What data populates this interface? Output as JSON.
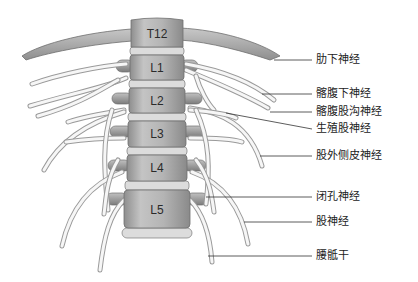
{
  "diagram": {
    "vertebrae": [
      "T12",
      "L1",
      "L2",
      "L3",
      "L4",
      "L5"
    ],
    "labels": [
      {
        "text": "肋下神经",
        "y": 54
      },
      {
        "text": "髂腹下神经",
        "y": 88
      },
      {
        "text": "髂腹股沟神经",
        "y": 106
      },
      {
        "text": "生殖股神经",
        "y": 123
      },
      {
        "text": "股外侧皮神经",
        "y": 150
      },
      {
        "text": "闭孔神经",
        "y": 191
      },
      {
        "text": "股神经",
        "y": 216
      },
      {
        "text": "腰骶干",
        "y": 250
      }
    ],
    "colors": {
      "bone_fill": "#b8b8b8",
      "bone_stroke": "#6e6e6e",
      "disc_fill": "#dcdcdc",
      "nerve_fill": "#f6f6f6",
      "nerve_stroke": "#9a9a9a",
      "leader": "#333333"
    }
  }
}
